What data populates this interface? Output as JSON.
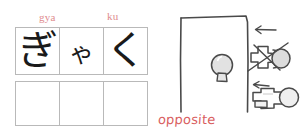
{
  "worksheet": {
    "kana_panel": {
      "romaji_labels": [
        {
          "text": "gya",
          "for_cell": 0
        },
        {
          "text": "ku",
          "for_cell": 2
        }
      ],
      "filled_row": {
        "cells": [
          {
            "glyph": "ぎ",
            "size": "big",
            "romaji": "gya"
          },
          {
            "glyph": "ゃ",
            "size": "small",
            "romaji": ""
          },
          {
            "glyph": "く",
            "size": "big",
            "romaji": "ku"
          }
        ]
      },
      "empty_row": {
        "cells": [
          {
            "glyph": "",
            "size": "big",
            "romaji": ""
          },
          {
            "glyph": "",
            "size": "big",
            "romaji": ""
          },
          {
            "glyph": "",
            "size": "big",
            "romaji": ""
          }
        ]
      }
    },
    "sketch_panel": {
      "caption": "opposite",
      "caption_color": "#d9605f",
      "door": {
        "label": "door-outline"
      },
      "doorknob": {
        "label": "round-doorknob-front-view"
      },
      "annotations": [
        {
          "name": "arrow-to-doorknob-crossed",
          "direction": "left"
        },
        {
          "name": "doorknob-crossed-out",
          "state": "not-this"
        },
        {
          "name": "arrow-to-lever-handle",
          "direction": "left"
        },
        {
          "name": "lever-handle-side-view",
          "state": "this-one"
        }
      ]
    }
  }
}
